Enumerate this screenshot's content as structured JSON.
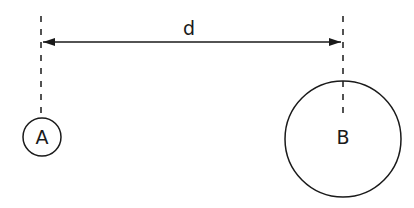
{
  "diagram": {
    "distance_label": "d",
    "nodes": [
      {
        "id": "A",
        "label": "A",
        "cx": 42,
        "cy": 137,
        "r": 19
      },
      {
        "id": "B",
        "label": "B",
        "cx": 343,
        "cy": 139,
        "r": 58
      }
    ],
    "guides": [
      {
        "x": 41,
        "y1": 16,
        "y2": 120
      },
      {
        "x": 343,
        "y1": 16,
        "y2": 100
      }
    ],
    "dimension_arrow": {
      "x1": 41,
      "x2": 343,
      "y": 42
    },
    "colors": {
      "stroke": "#1a1a1a",
      "background": "#ffffff"
    }
  }
}
